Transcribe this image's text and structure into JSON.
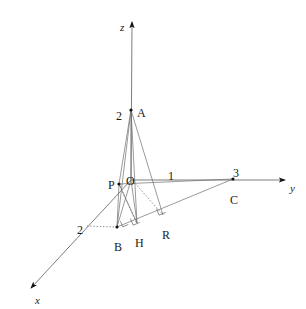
{
  "figure": {
    "background_color": "#ffffff",
    "line_color": "#6e6e6e",
    "dot_color": "#111111",
    "text_color": "#1a1a1a",
    "width": 306,
    "height": 309
  },
  "axes": [
    {
      "name": "z",
      "label": "z",
      "label_x": 120,
      "label_y": 22,
      "from_x": 131,
      "from_y": 180,
      "to_x": 132,
      "to_y": 22
    },
    {
      "name": "y",
      "label": "y",
      "label_x": 290,
      "label_y": 183,
      "from_x": 131,
      "from_y": 180,
      "to_x": 285,
      "to_y": 180
    },
    {
      "name": "x",
      "label": "x",
      "label_x": 35,
      "label_y": 295,
      "from_x": 131,
      "from_y": 180,
      "to_x": 31,
      "to_y": 288
    }
  ],
  "points": [
    {
      "name": "A",
      "label": "A",
      "x": 131,
      "y": 110,
      "label_dx": 6,
      "label_dy": -3,
      "dot": true
    },
    {
      "name": "O",
      "label": "O",
      "x": 131,
      "y": 180,
      "label_dx": -5,
      "label_dy": -5,
      "dot": false
    },
    {
      "name": "P",
      "label": "P",
      "x": 119,
      "y": 184,
      "label_dx": -11,
      "label_dy": -5,
      "dot": true
    },
    {
      "name": "B",
      "label": "B",
      "x": 117,
      "y": 227,
      "label_dx": -3,
      "label_dy": 14,
      "dot": true
    },
    {
      "name": "H",
      "label": "H",
      "x": 137,
      "y": 223,
      "label_dx": -2,
      "label_dy": 14,
      "dot": false
    },
    {
      "name": "R",
      "label": "R",
      "x": 163,
      "y": 215,
      "label_dx": -1,
      "label_dy": 14,
      "dot": false
    },
    {
      "name": "C",
      "label": "C",
      "x": 233,
      "y": 179,
      "label_dx": -3,
      "label_dy": 15,
      "dot": true
    }
  ],
  "tick_labels": [
    {
      "name": "z-tick-2",
      "text": "2",
      "x": 116,
      "y": 110,
      "axis": "z",
      "value": "2"
    },
    {
      "name": "y-tick-1",
      "text": "1",
      "x": 168,
      "y": 170,
      "axis": "y",
      "value": "1"
    },
    {
      "name": "y-tick-3",
      "text": "3",
      "x": 233,
      "y": 167,
      "axis": "y",
      "value": "3"
    },
    {
      "name": "x-tick-2",
      "text": "2",
      "x": 77,
      "y": 224,
      "axis": "x",
      "value": "2"
    }
  ],
  "solid_segments": [
    {
      "name": "segment-A-P",
      "x1": 131,
      "y1": 110,
      "x2": 119,
      "y2": 184
    },
    {
      "name": "segment-A-B",
      "x1": 131,
      "y1": 110,
      "x2": 117,
      "y2": 227
    },
    {
      "name": "segment-A-H",
      "x1": 131,
      "y1": 110,
      "x2": 137,
      "y2": 223
    },
    {
      "name": "segment-A-R",
      "x1": 131,
      "y1": 110,
      "x2": 163,
      "y2": 215
    },
    {
      "name": "segment-A-O",
      "x1": 131,
      "y1": 110,
      "x2": 131,
      "y2": 180
    },
    {
      "name": "segment-P-B",
      "x1": 119,
      "y1": 184,
      "x2": 117,
      "y2": 227
    },
    {
      "name": "segment-P-H",
      "x1": 119,
      "y1": 184,
      "x2": 137,
      "y2": 223
    },
    {
      "name": "segment-P-C",
      "x1": 119,
      "y1": 184,
      "x2": 233,
      "y2": 179
    },
    {
      "name": "segment-O-B",
      "x1": 131,
      "y1": 180,
      "x2": 117,
      "y2": 227
    },
    {
      "name": "segment-O-H",
      "x1": 131,
      "y1": 180,
      "x2": 137,
      "y2": 223
    },
    {
      "name": "segment-B-C",
      "x1": 117,
      "y1": 227,
      "x2": 233,
      "y2": 179
    }
  ],
  "dotted_segments": [
    {
      "name": "dotted-x-tick-to-B",
      "x1": 87,
      "y1": 226,
      "x2": 115,
      "y2": 227
    },
    {
      "name": "dotted-O-to-R",
      "x1": 133,
      "y1": 181,
      "x2": 163,
      "y2": 215
    },
    {
      "name": "dotted-P-to-H",
      "x1": 120,
      "y1": 186,
      "x2": 136,
      "y2": 222
    }
  ],
  "right_angle_marks": [
    {
      "name": "right-angle-at-B",
      "x": 126,
      "y": 219,
      "size": 6,
      "rotate": -22
    },
    {
      "name": "right-angle-at-H",
      "x": 137,
      "y": 216,
      "size": 7,
      "rotate": -22
    },
    {
      "name": "right-angle-at-R",
      "x": 163,
      "y": 206,
      "size": 7,
      "rotate": -22
    }
  ]
}
